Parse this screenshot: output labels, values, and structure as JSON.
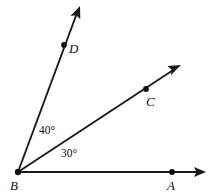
{
  "figure": {
    "type": "angle-diagram",
    "background_color": "#ffffff",
    "stroke_color": "#1a1a1a",
    "text_color": "#111111",
    "vertex": {
      "name": "B",
      "label": "B",
      "x": 18,
      "y": 172,
      "label_x": 10,
      "label_y": 190
    },
    "points": [
      {
        "name": "A",
        "label": "A",
        "x": 172,
        "y": 172,
        "label_x": 168,
        "label_y": 190,
        "on_ray": "BA"
      },
      {
        "name": "C",
        "label": "C",
        "x": 146,
        "y": 89,
        "label_x": 147,
        "label_y": 106,
        "on_ray": "BC"
      },
      {
        "name": "D",
        "label": "D",
        "x": 64,
        "y": 45,
        "label_x": 69,
        "label_y": 53,
        "on_ray": "BD"
      }
    ],
    "rays": [
      {
        "name": "BA",
        "from": "B",
        "through": "A",
        "start_x": 18,
        "start_y": 172,
        "tip_x": 206,
        "tip_y": 172,
        "angle_from_horizontal_deg": 0
      },
      {
        "name": "BC",
        "from": "B",
        "through": "C",
        "start_x": 18,
        "start_y": 172,
        "tip_x": 181,
        "tip_y": 65,
        "angle_from_horizontal_deg": 30
      },
      {
        "name": "BD",
        "from": "B",
        "through": "D",
        "start_x": 18,
        "start_y": 172,
        "tip_x": 80,
        "tip_y": 6,
        "angle_from_horizontal_deg": 70
      }
    ],
    "angles": [
      {
        "name": "angle-ABC",
        "label": "30°",
        "value": 30,
        "unit": "degrees",
        "between": [
          "BA",
          "BC"
        ],
        "label_x": 61,
        "label_y": 157
      },
      {
        "name": "angle-CBD",
        "label": "40°",
        "value": 40,
        "unit": "degrees",
        "between": [
          "BC",
          "BD"
        ],
        "label_x": 39,
        "label_y": 134
      }
    ]
  }
}
